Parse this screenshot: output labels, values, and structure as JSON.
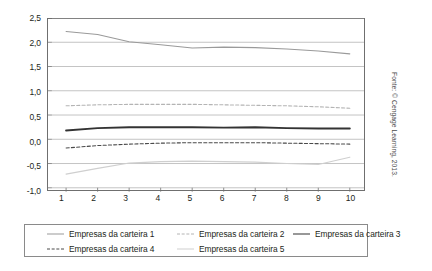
{
  "chart_data": {
    "type": "line",
    "title": "",
    "subtitle": "",
    "xlabel": "",
    "ylabel": "",
    "x": [
      1,
      2,
      3,
      4,
      5,
      6,
      7,
      8,
      9,
      10
    ],
    "xtick_labels": [
      "1",
      "2",
      "3",
      "4",
      "5",
      "6",
      "7",
      "8",
      "9",
      "10"
    ],
    "ytick_labels": [
      "2,5",
      "2,0",
      "1,5",
      "1,0",
      "0,5",
      "0,0",
      "-0,5",
      "-1,0"
    ],
    "ytick_values": [
      2.5,
      2.0,
      1.5,
      1.0,
      0.5,
      0.0,
      -0.5,
      -1.0
    ],
    "xlim": [
      0.55,
      10.45
    ],
    "ylim": [
      -1.0,
      2.5
    ],
    "grid": "horizontal",
    "legend_position": "bottom",
    "series": [
      {
        "name": "Empresas da carteira 1",
        "style": "solid",
        "color": "#9a9a9a",
        "width": 1.1,
        "values": [
          2.22,
          2.16,
          2.01,
          1.95,
          1.88,
          1.9,
          1.89,
          1.86,
          1.82,
          1.76
        ]
      },
      {
        "name": "Empresas da carteira 2",
        "style": "dashed",
        "color": "#b4b4b4",
        "width": 1.1,
        "values": [
          0.69,
          0.71,
          0.72,
          0.72,
          0.72,
          0.71,
          0.7,
          0.69,
          0.67,
          0.64
        ]
      },
      {
        "name": "Empresas da carteira 3",
        "style": "solid",
        "color": "#333333",
        "width": 2.0,
        "values": [
          0.18,
          0.23,
          0.25,
          0.25,
          0.25,
          0.24,
          0.25,
          0.23,
          0.22,
          0.22
        ]
      },
      {
        "name": "Empresas da carteira 4",
        "style": "dashed",
        "color": "#4a4a4a",
        "width": 1.1,
        "values": [
          -0.18,
          -0.13,
          -0.1,
          -0.08,
          -0.07,
          -0.07,
          -0.07,
          -0.08,
          -0.09,
          -0.1
        ]
      },
      {
        "name": "Empresas da carteira 5",
        "style": "solid",
        "color": "#cfcfcf",
        "width": 1.2,
        "values": [
          -0.72,
          -0.6,
          -0.49,
          -0.46,
          -0.45,
          -0.46,
          -0.47,
          -0.5,
          -0.52,
          -0.37
        ]
      }
    ]
  },
  "legend": {
    "items": [
      {
        "label": "Empresas da carteira 1",
        "swatch": "sw-s1"
      },
      {
        "label": "Empresas da carteira 2",
        "swatch": "sw-s2"
      },
      {
        "label": "Empresas da carteira 3",
        "swatch": "sw-s3"
      },
      {
        "label": "Empresas da carteira 4",
        "swatch": "sw-s4"
      },
      {
        "label": "Empresas da carteira 5",
        "swatch": "sw-s5"
      }
    ]
  },
  "source_note": "Fonte: © Cengage Learning, 2013."
}
